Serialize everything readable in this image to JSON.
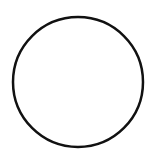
{
  "diagram": {
    "background": "#ffffff",
    "shapes": [
      {
        "type": "circle",
        "name": "circle-outline",
        "cx": 78,
        "cy": 82,
        "r": 65,
        "stroke": "#111111",
        "stroke_width": 2.5,
        "fill": "none"
      }
    ]
  }
}
